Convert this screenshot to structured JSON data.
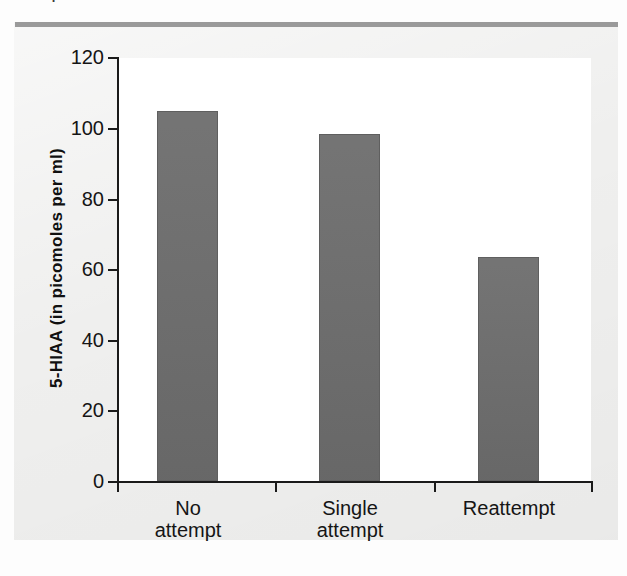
{
  "page": {
    "cropped_caption": "attempted."
  },
  "figure": {
    "panel_bg": "#efefee",
    "rule_color": "#9a9a9a",
    "plot_bg": "#ffffff",
    "axis_color": "#1a1a1a",
    "bar_color": "#6d6d6d"
  },
  "chart_data": {
    "type": "bar",
    "title": "",
    "xlabel": "",
    "ylabel": "5-HIAA (in picomoles per ml)",
    "categories": [
      "No attempt",
      "Single attempt",
      "Reattempt"
    ],
    "category_lines": [
      [
        "No",
        "attempt"
      ],
      [
        "Single",
        "attempt"
      ],
      [
        "Reattempt"
      ]
    ],
    "values": [
      105,
      98.5,
      63.5
    ],
    "ylim": [
      0,
      120
    ],
    "yticks": [
      0,
      20,
      40,
      60,
      80,
      100,
      120
    ],
    "ytick_labels": [
      "0",
      "20",
      "40",
      "60",
      "80",
      "100",
      "120"
    ],
    "grid": false,
    "legend": null,
    "bar_color": "#6d6d6d"
  }
}
